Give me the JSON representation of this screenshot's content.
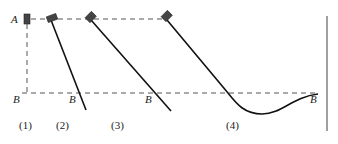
{
  "diagram": {
    "type": "physics-pendulum-sequence",
    "colors": {
      "line": "#111111",
      "dashed": "#555555",
      "block": "#444444",
      "wall": "#888888"
    },
    "points": {
      "A_label": "A",
      "B_labels": [
        "B",
        "B",
        "B",
        "B"
      ]
    },
    "panels": [
      {
        "id": "1",
        "label": "(1)"
      },
      {
        "id": "2",
        "label": "(2)"
      },
      {
        "id": "3",
        "label": "(3)"
      },
      {
        "id": "4",
        "label": "(4)"
      }
    ]
  }
}
